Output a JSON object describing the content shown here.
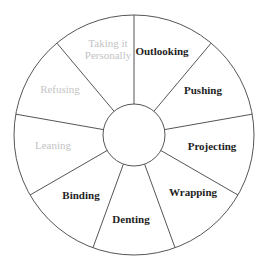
{
  "diagram": {
    "type": "wheel",
    "center": {
      "x": 134,
      "y": 135
    },
    "outer_radius": 120,
    "inner_radius": 31,
    "stroke_color": "#555555",
    "active_text_color": "#1e1e1e",
    "inactive_text_color": "#c4c4c4",
    "spoke_angles_deg": [
      -90,
      -50,
      -10,
      30,
      70,
      110,
      150,
      190,
      230
    ],
    "segments": [
      {
        "id": "outlooking",
        "lines": [
          "Outlooking"
        ],
        "active": true,
        "x": 162,
        "y": 52
      },
      {
        "id": "pushing",
        "lines": [
          "Pushing"
        ],
        "active": true,
        "x": 203,
        "y": 91
      },
      {
        "id": "projecting",
        "lines": [
          "Projecting"
        ],
        "active": true,
        "x": 212,
        "y": 147
      },
      {
        "id": "wrapping",
        "lines": [
          "Wrapping"
        ],
        "active": true,
        "x": 193,
        "y": 193
      },
      {
        "id": "denting",
        "lines": [
          "Denting"
        ],
        "active": true,
        "x": 131,
        "y": 220
      },
      {
        "id": "binding",
        "lines": [
          "Binding"
        ],
        "active": true,
        "x": 81,
        "y": 196
      },
      {
        "id": "leaning",
        "lines": [
          "Leaning"
        ],
        "active": false,
        "x": 53,
        "y": 146
      },
      {
        "id": "refusing",
        "lines": [
          "Refusing"
        ],
        "active": false,
        "x": 60,
        "y": 90
      },
      {
        "id": "taking-it-personally",
        "lines": [
          "Taking it",
          "Personally"
        ],
        "active": false,
        "x": 108,
        "y": 50
      }
    ]
  }
}
